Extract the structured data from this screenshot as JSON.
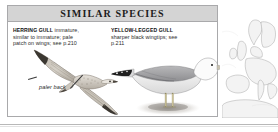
{
  "panel": {
    "title": "SIMILAR SPECIES",
    "header_bg": "#d4d4d4",
    "border_color": "#a9a9ab",
    "background": "#ffffff"
  },
  "species": [
    {
      "id": "herring-gull",
      "name": "HERRING GULL",
      "description": "immature, similar to immature; pale patch on wings; see p.210",
      "page_reference": "p.210",
      "illustration": "flying-gull-from-above"
    },
    {
      "id": "yellow-legged-gull",
      "name": "YELLOW-LEGGED GULL",
      "description": "sharper black wingtips; see p.211",
      "page_reference": "p.211",
      "illustration": "standing-gull-side-view"
    }
  ],
  "annotations": [
    {
      "id": "paler-back",
      "text": "paler back",
      "style": "italic"
    }
  ],
  "range_map": {
    "name": "europe-range-map",
    "region": "Europe",
    "coastline_color": "#9a9a9a",
    "land_color": "#f2f2f2",
    "sea_color": "#ffffff"
  }
}
